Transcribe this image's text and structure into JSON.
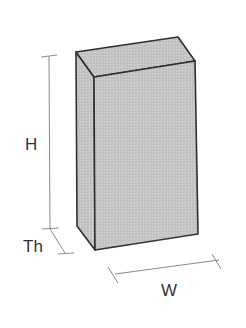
{
  "diagram": {
    "type": "rectangular-block-dimensions",
    "labels": {
      "height": "H",
      "thickness": "Th",
      "width": "W"
    },
    "colors": {
      "face_front": "#c4c4c4",
      "face_top": "#cacaca",
      "face_side": "#bdbdbd",
      "edge": "#2f2f2f",
      "dimension_line": "#8a8a8a",
      "label": "#333333"
    }
  }
}
